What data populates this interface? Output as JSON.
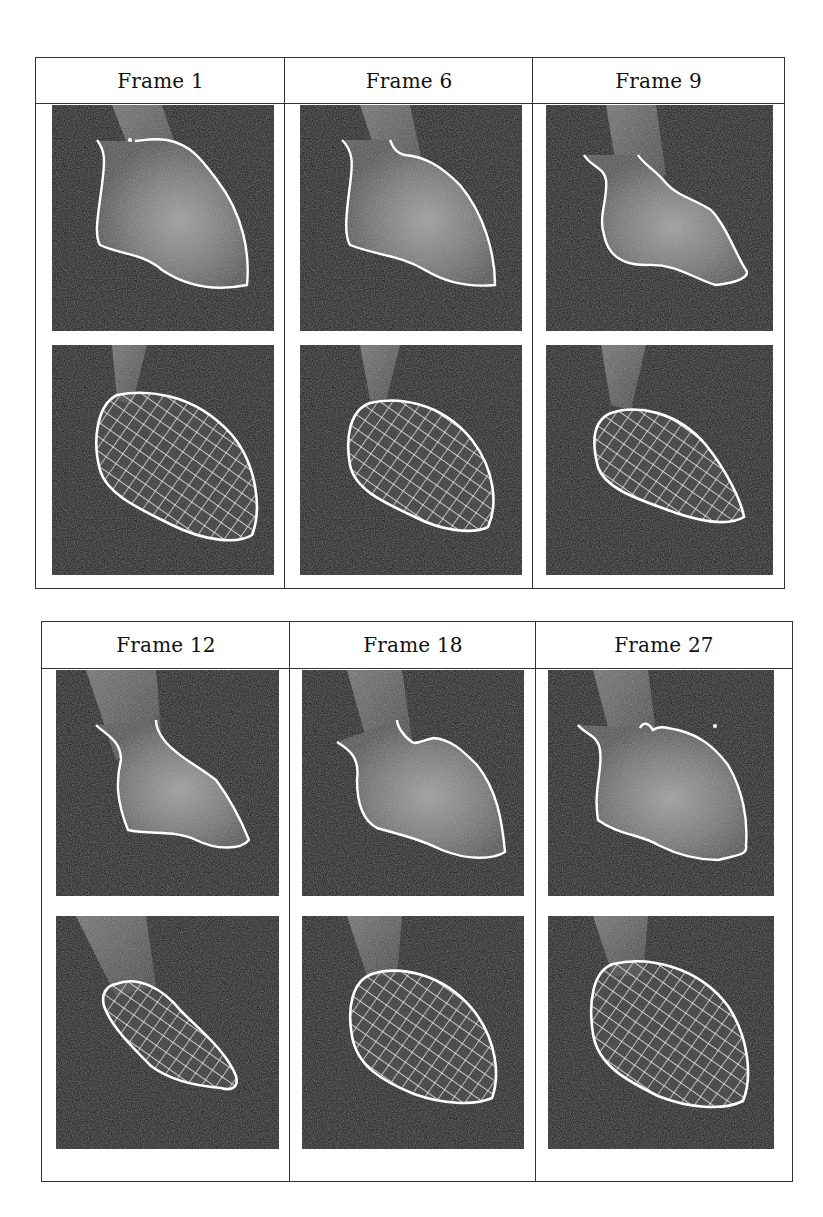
{
  "figure": {
    "tables": [
      {
        "columns": [
          {
            "header": "Frame 1",
            "contour": "frame1",
            "mesh": "mesh1"
          },
          {
            "header": "Frame 6",
            "contour": "frame6",
            "mesh": "mesh6"
          },
          {
            "header": "Frame 9",
            "contour": "frame9",
            "mesh": "mesh9"
          }
        ],
        "rows": [
          "segmented-contour",
          "wireframe-model"
        ]
      },
      {
        "columns": [
          {
            "header": "Frame 12",
            "contour": "frame12",
            "mesh": "mesh12"
          },
          {
            "header": "Frame 18",
            "contour": "frame18",
            "mesh": "mesh18"
          },
          {
            "header": "Frame 27",
            "contour": "frame27",
            "mesh": "mesh27"
          }
        ],
        "rows": [
          "segmented-contour",
          "wireframe-model"
        ]
      }
    ],
    "colors": {
      "background": "#ffffff",
      "border": "#333333",
      "image_bg": "#151515",
      "overlay": "#ffffff"
    }
  }
}
